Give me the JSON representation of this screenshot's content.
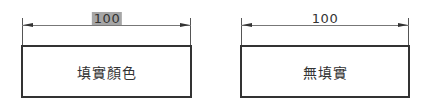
{
  "figures": [
    {
      "id": "filled",
      "dimension_label": "100",
      "dimension_highlighted": true,
      "box_label": "填實顏色"
    },
    {
      "id": "no-fill",
      "dimension_label": "100",
      "dimension_highlighted": false,
      "box_label": "無填實"
    }
  ],
  "colors": {
    "line": "#333333",
    "highlight": "#a6a6a6",
    "background": "#ffffff"
  }
}
